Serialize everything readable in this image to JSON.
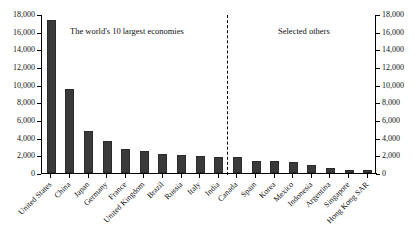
{
  "chart_data": {
    "type": "bar",
    "title": "",
    "subtitle": "",
    "xlabel": "",
    "ylabel": "",
    "ylim": [
      0,
      18000
    ],
    "ytick_step": 2000,
    "grid": false,
    "legend": "none",
    "dual_axis": true,
    "axis_ticks": [
      "18,000",
      "16,000",
      "14,000",
      "12,000",
      "10,000",
      "8,000",
      "6,000",
      "4,000",
      "2,000",
      "0"
    ],
    "axis_tick_values": [
      18000,
      16000,
      14000,
      12000,
      10000,
      8000,
      6000,
      4000,
      2000,
      0
    ],
    "annotations": [
      {
        "name": "group-caption-left",
        "text": "The world's 10 largest economies"
      },
      {
        "name": "group-caption-right",
        "text": "Selected others"
      },
      {
        "name": "group-divider",
        "text": ""
      }
    ],
    "categories": [
      "United States",
      "China",
      "Japan",
      "Germany",
      "France",
      "United Kingdom",
      "Brazil",
      "Russia",
      "Italy",
      "India",
      "Canada",
      "Spain",
      "Korea",
      "Mexico",
      "Indonesia",
      "Argentina",
      "Singapore",
      "Hong Kong SAR"
    ],
    "values": [
      17300,
      9500,
      4800,
      3600,
      2700,
      2450,
      2150,
      2050,
      1950,
      1850,
      1800,
      1400,
      1390,
      1280,
      890,
      550,
      300,
      290
    ],
    "groups": [
      {
        "name": "The world's 10 largest economies",
        "start_index": 0,
        "end_index": 9
      },
      {
        "name": "Selected others",
        "start_index": 10,
        "end_index": 17
      }
    ],
    "bar_color": "#3a3a3a"
  }
}
